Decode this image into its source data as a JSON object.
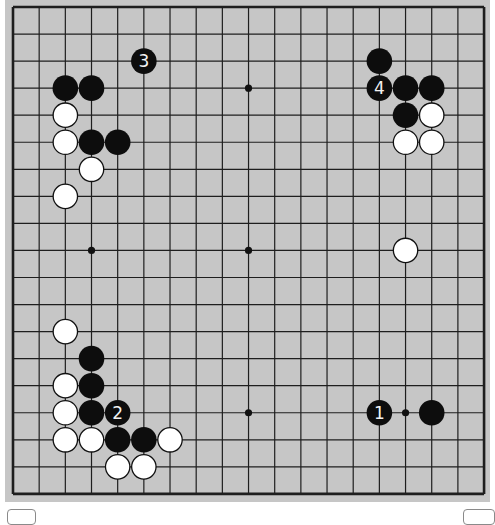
{
  "board": {
    "size": 19,
    "background_color": "#c6c6c6",
    "line_color": "#1e1e1e",
    "origin_x": 13,
    "origin_y": 7,
    "spacing_x": 26.17,
    "spacing_y": 27.05,
    "stone_radius": 12.8,
    "star_points": [
      [
        3,
        3
      ],
      [
        9,
        3
      ],
      [
        15,
        3
      ],
      [
        3,
        9
      ],
      [
        9,
        9
      ],
      [
        15,
        9
      ],
      [
        3,
        15
      ],
      [
        9,
        15
      ],
      [
        15,
        15
      ]
    ]
  },
  "stones": [
    {
      "color": "black",
      "col": 5,
      "row": 2,
      "label": "3"
    },
    {
      "color": "black",
      "col": 2,
      "row": 3,
      "label": ""
    },
    {
      "color": "black",
      "col": 3,
      "row": 3,
      "label": ""
    },
    {
      "color": "white",
      "col": 2,
      "row": 4,
      "label": ""
    },
    {
      "color": "white",
      "col": 2,
      "row": 5,
      "label": ""
    },
    {
      "color": "black",
      "col": 3,
      "row": 5,
      "label": ""
    },
    {
      "color": "black",
      "col": 4,
      "row": 5,
      "label": ""
    },
    {
      "color": "white",
      "col": 3,
      "row": 6,
      "label": ""
    },
    {
      "color": "white",
      "col": 2,
      "row": 7,
      "label": ""
    },
    {
      "color": "black",
      "col": 14,
      "row": 2,
      "label": ""
    },
    {
      "color": "black",
      "col": 14,
      "row": 3,
      "label": "4"
    },
    {
      "color": "black",
      "col": 15,
      "row": 3,
      "label": ""
    },
    {
      "color": "black",
      "col": 16,
      "row": 3,
      "label": ""
    },
    {
      "color": "black",
      "col": 15,
      "row": 4,
      "label": ""
    },
    {
      "color": "white",
      "col": 16,
      "row": 4,
      "label": ""
    },
    {
      "color": "white",
      "col": 15,
      "row": 5,
      "label": ""
    },
    {
      "color": "white",
      "col": 16,
      "row": 5,
      "label": ""
    },
    {
      "color": "white",
      "col": 15,
      "row": 9,
      "label": ""
    },
    {
      "color": "white",
      "col": 2,
      "row": 12,
      "label": ""
    },
    {
      "color": "black",
      "col": 3,
      "row": 13,
      "label": ""
    },
    {
      "color": "white",
      "col": 2,
      "row": 14,
      "label": ""
    },
    {
      "color": "black",
      "col": 3,
      "row": 14,
      "label": ""
    },
    {
      "color": "white",
      "col": 2,
      "row": 15,
      "label": ""
    },
    {
      "color": "black",
      "col": 3,
      "row": 15,
      "label": ""
    },
    {
      "color": "black",
      "col": 4,
      "row": 15,
      "label": "2"
    },
    {
      "color": "white",
      "col": 2,
      "row": 16,
      "label": ""
    },
    {
      "color": "white",
      "col": 3,
      "row": 16,
      "label": ""
    },
    {
      "color": "black",
      "col": 4,
      "row": 16,
      "label": ""
    },
    {
      "color": "black",
      "col": 5,
      "row": 16,
      "label": ""
    },
    {
      "color": "white",
      "col": 6,
      "row": 16,
      "label": ""
    },
    {
      "color": "white",
      "col": 4,
      "row": 17,
      "label": ""
    },
    {
      "color": "white",
      "col": 5,
      "row": 17,
      "label": ""
    },
    {
      "color": "black",
      "col": 14,
      "row": 15,
      "label": "1"
    },
    {
      "color": "black",
      "col": 16,
      "row": 15,
      "label": ""
    }
  ],
  "footer": {
    "left_fragment": "",
    "right_fragment": ""
  }
}
